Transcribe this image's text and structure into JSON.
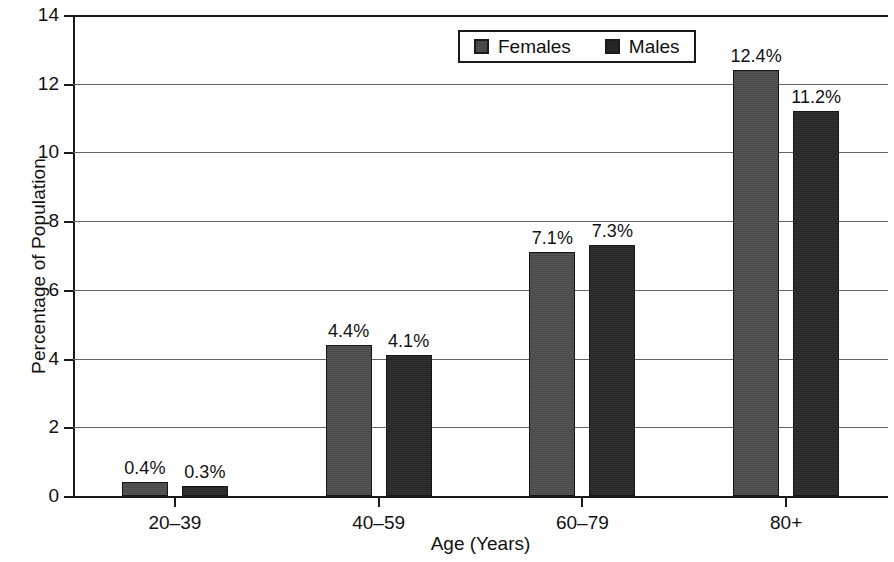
{
  "chart_data": {
    "type": "bar",
    "title": "",
    "xlabel": "Age (Years)",
    "ylabel": "Percentage of Population",
    "categories": [
      "20–39",
      "40–59",
      "60–79",
      "80+"
    ],
    "series": [
      {
        "name": "Females",
        "color": "#4a4a4a",
        "values": [
          0.4,
          4.4,
          7.1,
          12.4
        ],
        "labels": [
          "0.4%",
          "4.4%",
          "7.1%",
          "12.4%"
        ]
      },
      {
        "name": "Males",
        "color": "#262626",
        "values": [
          0.3,
          4.1,
          7.3,
          11.2
        ],
        "labels": [
          "0.3%",
          "4.1%",
          "7.3%",
          "11.2%"
        ]
      }
    ],
    "ylim": [
      0,
      14
    ],
    "yticks": [
      0,
      2,
      4,
      6,
      8,
      10,
      12,
      14
    ],
    "ytick_labels": [
      "0",
      "2",
      "4",
      "6",
      "8",
      "10",
      "12",
      "14"
    ],
    "grid": "horizontal",
    "legend_position": "top-center"
  },
  "legend": {
    "entries": [
      {
        "label": "Females"
      },
      {
        "label": "Males"
      }
    ]
  },
  "axes": {
    "x_title": "Age (Years)",
    "y_title": "Percentage of Population"
  }
}
